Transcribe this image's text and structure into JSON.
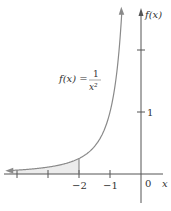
{
  "chart_data": {
    "type": "line",
    "title": "",
    "function_label": {
      "lhs": "f(x) =",
      "numerator": "1",
      "denominator": "x²"
    },
    "xlabel": "x",
    "ylabel": "f(x)",
    "x_ticks": [
      -4,
      -3,
      -2,
      -1,
      0
    ],
    "x_tick_labels": [
      "",
      "",
      "−2",
      "−1",
      "0"
    ],
    "y_ticks": [
      1,
      2
    ],
    "y_tick_labels": [
      "1",
      ""
    ],
    "xlim": [
      -4.3,
      0.9
    ],
    "ylim": [
      -0.5,
      2.8
    ],
    "series": [
      {
        "name": "f(x) = 1/x^2",
        "x": [
          -4.2,
          -4,
          -3,
          -2,
          -1.5,
          -1,
          -0.8,
          -0.7,
          -0.62
        ],
        "y": [
          0.057,
          0.0625,
          0.111,
          0.25,
          0.444,
          1.0,
          1.5625,
          2.04,
          2.6
        ]
      }
    ],
    "shaded_region": {
      "from_x": -4.2,
      "to_x": -2,
      "between": "curve and x-axis"
    },
    "grid": false,
    "legend": "none"
  },
  "colors": {
    "curve": "#8a8a8a",
    "axis": "#555555",
    "shade": "#ececec"
  }
}
